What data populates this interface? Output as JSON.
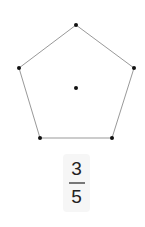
{
  "diagram": {
    "shape": "regular-pentagon",
    "vertices": [
      [
        76,
        25
      ],
      [
        134,
        68
      ],
      [
        112,
        138
      ],
      [
        40,
        138
      ],
      [
        19,
        68
      ]
    ],
    "center": [
      76,
      88
    ],
    "stroke_color": "#999999",
    "point_color": "#111111"
  },
  "fraction": {
    "numerator": "3",
    "denominator": "5"
  }
}
